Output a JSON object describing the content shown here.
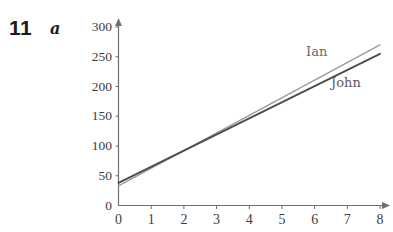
{
  "question": {
    "number": "11",
    "part": "a"
  },
  "chart_data": {
    "type": "line",
    "title": "",
    "subtitle": "",
    "xlabel": "",
    "ylabel": "",
    "xlim": [
      0,
      8
    ],
    "ylim": [
      0,
      300
    ],
    "grid": false,
    "legend_position": "inline-right",
    "x_ticks": [
      "0",
      "1",
      "2",
      "3",
      "4",
      "5",
      "6",
      "7",
      "8"
    ],
    "x_tick_values": [
      0,
      1,
      2,
      3,
      4,
      5,
      6,
      7,
      8
    ],
    "y_ticks": [
      "0",
      "50",
      "100",
      "150",
      "200",
      "250",
      "300"
    ],
    "y_tick_values": [
      0,
      50,
      100,
      150,
      200,
      250,
      300
    ],
    "x_axis_arrow": true,
    "y_axis_arrow": true,
    "x": [
      0,
      8
    ],
    "series": [
      {
        "name": "Ian",
        "label": "Ian",
        "color": "#9a9a9a",
        "values": [
          33,
          270
        ],
        "intercept": 33,
        "slope": 29.6
      },
      {
        "name": "John",
        "label": "John",
        "color": "#4d4d4d",
        "values": [
          38,
          255
        ],
        "intercept": 38,
        "slope": 27.1
      }
    ],
    "intersection": {
      "x": 3.5,
      "y": 137
    },
    "annotations": [
      {
        "text": "Ian",
        "x": 6.6,
        "y": 250
      },
      {
        "text": "John",
        "x": 7.4,
        "y": 210
      }
    ],
    "axis_color": "#6e6e6e"
  }
}
